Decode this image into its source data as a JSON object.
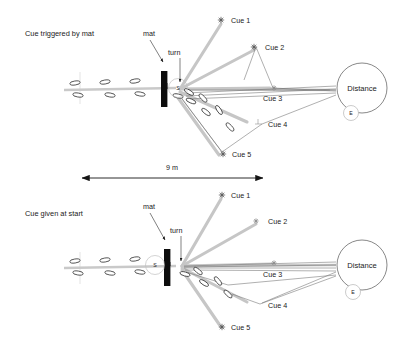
{
  "figure": {
    "title_hidden": "",
    "scale_label": "9 m",
    "panels": [
      {
        "id": "top",
        "condition_label": "Cue triggered by mat",
        "mat_label": "mat",
        "turn_label": "turn",
        "start_marker": "S",
        "end_marker": "E",
        "distance_label": "Distance",
        "cues": [
          {
            "name": "Cue 1",
            "x": 227,
            "y": 20
          },
          {
            "name": "Cue 2",
            "x": 259,
            "y": 47
          },
          {
            "name": "Cue 3",
            "x": 277,
            "y": 88
          },
          {
            "name": "Cue 4",
            "x": 258,
            "y": 126
          },
          {
            "name": "Cue 5",
            "x": 224,
            "y": 155
          }
        ]
      },
      {
        "id": "bottom",
        "condition_label": "Cue given at start",
        "mat_label": "mat",
        "turn_label": "turn",
        "start_marker": "S",
        "end_marker": "E",
        "distance_label": "Distance",
        "cues": [
          {
            "name": "Cue 1",
            "x": 227,
            "y": 195
          },
          {
            "name": "Cue 2",
            "x": 259,
            "y": 220
          },
          {
            "name": "Cue 3",
            "x": 277,
            "y": 262
          },
          {
            "name": "Cue 4",
            "x": 258,
            "y": 306
          },
          {
            "name": "Cue 5",
            "x": 224,
            "y": 328
          }
        ]
      }
    ],
    "colors": {
      "ray": "#c6c6c6",
      "thin_line": "#6e6e6e",
      "mat": "#0d0d0d",
      "path": "#c9c9c9",
      "text": "#1a1a1a",
      "background": "#ffffff"
    }
  },
  "labels": {
    "top_condition": "Cue triggered by mat",
    "bottom_condition": "Cue given at start",
    "mat": "mat",
    "turn": "turn",
    "distance": "Distance",
    "scale": "9 m",
    "start": "S",
    "end": "E",
    "cue1": "Cue 1",
    "cue2": "Cue 2",
    "cue3": "Cue 3",
    "cue4": "Cue 4",
    "cue5": "Cue 5"
  }
}
